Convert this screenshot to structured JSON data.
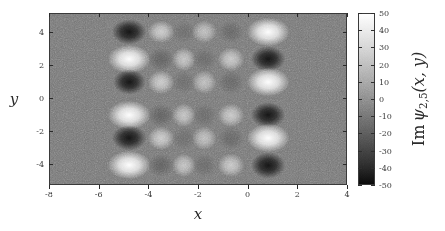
{
  "figure": {
    "kind": "grayscale-heatmap",
    "background_color": "#767676",
    "frame_color": "#3a3a3a"
  },
  "axes": {
    "x_title": "x",
    "y_title": "y",
    "x_ticks": [
      -8,
      -6,
      -4,
      -2,
      0,
      2,
      4
    ],
    "x_tick_labels": [
      "-8",
      "-6",
      "-4",
      "-2",
      "0",
      "2",
      "4"
    ],
    "y_ticks": [
      4,
      2,
      0,
      -2,
      -4
    ],
    "y_tick_labels": [
      "4",
      "2",
      "0",
      "-2",
      "-4"
    ],
    "xlim": [
      -8,
      4
    ],
    "ylim": [
      -5.3,
      5.15
    ]
  },
  "colorbar": {
    "title_prefix": "Im",
    "title_symbol": "ψ",
    "title_subscript": "2,5",
    "title_args": "(x, y)",
    "ticks": [
      50,
      40,
      30,
      20,
      10,
      0,
      -10,
      -20,
      -30,
      -40,
      -50
    ],
    "tick_labels": [
      "50",
      "40",
      "30",
      "20",
      "10",
      "0",
      "-10",
      "-20",
      "-30",
      "-40",
      "-50"
    ],
    "vmin": -50,
    "vmax": 50,
    "cmap": "gray",
    "low_color": "#0a0a0a",
    "high_color": "#ffffff",
    "mid_color": "#767676"
  },
  "chart_data": {
    "type": "heatmap",
    "title": "",
    "xlabel": "x",
    "ylabel": "y",
    "zlabel": "Im ψ_{2,5}(x, y)",
    "xlim": [
      -8,
      4
    ],
    "ylim": [
      -5.3,
      5.15
    ],
    "zlim": [
      -50,
      50
    ],
    "colormap": "gray",
    "grid": false,
    "legend": "none",
    "lobes": [
      {
        "x": -4.8,
        "y": 4.05,
        "v": -46,
        "rx": 13,
        "ry": 9
      },
      {
        "x": -4.8,
        "y": 2.4,
        "v": 49,
        "rx": 16,
        "ry": 10
      },
      {
        "x": -4.8,
        "y": 1.0,
        "v": -46,
        "rx": 12,
        "ry": 9
      },
      {
        "x": -4.8,
        "y": -1.0,
        "v": 49,
        "rx": 16,
        "ry": 10
      },
      {
        "x": -4.8,
        "y": -2.4,
        "v": -46,
        "rx": 13,
        "ry": 9
      },
      {
        "x": -4.8,
        "y": -4.05,
        "v": 49,
        "rx": 16,
        "ry": 10
      },
      {
        "x": -3.52,
        "y": 4.05,
        "v": 27,
        "rx": 10,
        "ry": 8
      },
      {
        "x": -3.52,
        "y": 2.4,
        "v": -16,
        "rx": 10,
        "ry": 8
      },
      {
        "x": -3.52,
        "y": 1.0,
        "v": 27,
        "rx": 10,
        "ry": 8
      },
      {
        "x": -3.52,
        "y": -1.0,
        "v": -16,
        "rx": 10,
        "ry": 8
      },
      {
        "x": -3.52,
        "y": -2.4,
        "v": 27,
        "rx": 10,
        "ry": 8
      },
      {
        "x": -3.52,
        "y": -4.05,
        "v": -16,
        "rx": 10,
        "ry": 8
      },
      {
        "x": -2.6,
        "y": 4.05,
        "v": -12,
        "rx": 9,
        "ry": 8
      },
      {
        "x": -2.6,
        "y": 2.4,
        "v": 24,
        "rx": 9,
        "ry": 8
      },
      {
        "x": -2.6,
        "y": 1.0,
        "v": -12,
        "rx": 9,
        "ry": 8
      },
      {
        "x": -2.6,
        "y": -1.0,
        "v": 24,
        "rx": 9,
        "ry": 8
      },
      {
        "x": -2.6,
        "y": -2.4,
        "v": -12,
        "rx": 9,
        "ry": 8
      },
      {
        "x": -2.6,
        "y": -4.05,
        "v": 24,
        "rx": 9,
        "ry": 8
      },
      {
        "x": -1.78,
        "y": 4.05,
        "v": 22,
        "rx": 9,
        "ry": 8
      },
      {
        "x": -1.78,
        "y": 2.4,
        "v": -13,
        "rx": 9,
        "ry": 8
      },
      {
        "x": -1.78,
        "y": 1.0,
        "v": 22,
        "rx": 9,
        "ry": 8
      },
      {
        "x": -1.78,
        "y": -1.0,
        "v": -13,
        "rx": 9,
        "ry": 8
      },
      {
        "x": -1.78,
        "y": -2.4,
        "v": 22,
        "rx": 9,
        "ry": 8
      },
      {
        "x": -1.78,
        "y": -4.05,
        "v": -13,
        "rx": 9,
        "ry": 8
      },
      {
        "x": -0.7,
        "y": 4.05,
        "v": -14,
        "rx": 10,
        "ry": 8
      },
      {
        "x": -0.7,
        "y": 2.4,
        "v": 26,
        "rx": 10,
        "ry": 8
      },
      {
        "x": -0.7,
        "y": 1.0,
        "v": -14,
        "rx": 10,
        "ry": 8
      },
      {
        "x": -0.7,
        "y": -1.0,
        "v": 26,
        "rx": 10,
        "ry": 8
      },
      {
        "x": -0.7,
        "y": -2.4,
        "v": -14,
        "rx": 10,
        "ry": 8
      },
      {
        "x": -0.7,
        "y": -4.05,
        "v": 26,
        "rx": 10,
        "ry": 8
      },
      {
        "x": 0.78,
        "y": 4.05,
        "v": 49,
        "rx": 16,
        "ry": 10
      },
      {
        "x": 0.78,
        "y": 2.4,
        "v": -46,
        "rx": 13,
        "ry": 9
      },
      {
        "x": 0.78,
        "y": 1.0,
        "v": 49,
        "rx": 16,
        "ry": 10
      },
      {
        "x": 0.78,
        "y": -1.0,
        "v": -46,
        "rx": 13,
        "ry": 9
      },
      {
        "x": 0.78,
        "y": -2.4,
        "v": 49,
        "rx": 16,
        "ry": 10
      },
      {
        "x": 0.78,
        "y": -4.05,
        "v": -46,
        "rx": 13,
        "ry": 9
      }
    ]
  }
}
